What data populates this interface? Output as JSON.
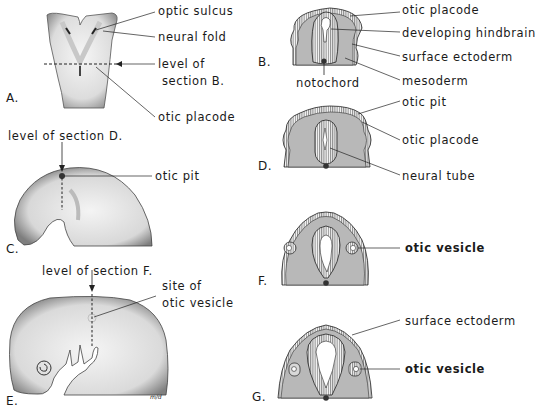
{
  "figure": {
    "panels": [
      {
        "id": "A",
        "letter": "A.",
        "description": "dorsal view of embryo",
        "labels": {
          "optic_sulcus": "optic sulcus",
          "neural_fold": "neural fold",
          "level_of": "level of",
          "section_b": "section B.",
          "otic_placode": "otic placode"
        }
      },
      {
        "id": "B",
        "letter": "B.",
        "description": "transverse section",
        "labels": {
          "otic_placode": "otic placode",
          "developing_hindbrain": "developing hindbrain",
          "surface_ectoderm": "surface ectoderm",
          "mesoderm": "mesoderm",
          "notochord": "notochord"
        }
      },
      {
        "id": "C",
        "letter": "C.",
        "description": "lateral view of embryo",
        "labels": {
          "level_of_section_d": "level of section D.",
          "otic_pit": "otic pit"
        }
      },
      {
        "id": "D",
        "letter": "D.",
        "description": "transverse section",
        "labels": {
          "otic_pit": "otic pit",
          "otic_placode": "otic placode",
          "neural_tube": "neural tube"
        }
      },
      {
        "id": "E",
        "letter": "E.",
        "description": "lateral view of embryo",
        "labels": {
          "level_of_section_f": "level of section F.",
          "site_of": "site of",
          "otic_vesicle": "otic vesicle",
          "signature": "m/d"
        }
      },
      {
        "id": "F",
        "letter": "F.",
        "description": "transverse section",
        "labels": {
          "otic_vesicle": "otic vesicle"
        }
      },
      {
        "id": "G",
        "letter": "G.",
        "description": "transverse section",
        "labels": {
          "surface_ectoderm": "surface ectoderm",
          "otic_vesicle": "otic vesicle"
        }
      }
    ],
    "colors": {
      "background": "#ffffff",
      "ink": "#1a1a1a",
      "mesoderm_fill": "#b8b8b8",
      "embryo_fill": "#f2f2f2",
      "embryo_shade": "#9a9a9a"
    }
  }
}
